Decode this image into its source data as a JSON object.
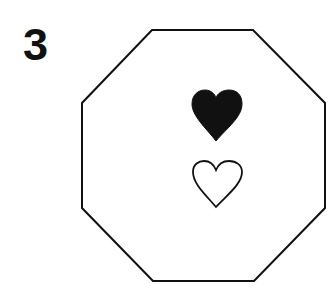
{
  "figure": {
    "label": "3",
    "shape": "octagon",
    "symbols": [
      {
        "name": "heart",
        "style": "filled",
        "position": "upper"
      },
      {
        "name": "heart",
        "style": "outline",
        "position": "lower"
      }
    ],
    "colors": {
      "stroke": "#111111",
      "fill": "#111111",
      "background": "#ffffff"
    }
  }
}
